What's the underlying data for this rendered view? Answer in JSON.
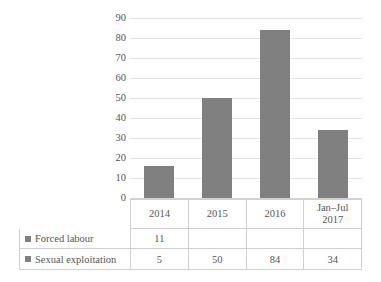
{
  "chart_data": {
    "type": "bar",
    "title": "",
    "xlabel": "",
    "ylabel": "",
    "categories": [
      "2014",
      "2015",
      "2016",
      "Jan–Jul 2017"
    ],
    "values": [
      16,
      50,
      84,
      34
    ],
    "ylim": [
      0,
      90
    ],
    "yticks": [
      0,
      10,
      20,
      30,
      40,
      50,
      60,
      70,
      80,
      90
    ],
    "ytick_labels": [
      "0",
      "10",
      "20",
      "30",
      "40",
      "50",
      "60",
      "70",
      "80",
      "90"
    ],
    "grid": true,
    "legend_position": "data-table",
    "bar_color": "#808080",
    "gridline_color": "#e2e2e2",
    "series": [
      {
        "name": "Forced labour",
        "values": [
          "11",
          "",
          "",
          ""
        ]
      },
      {
        "name": "Sexual exploitation",
        "values": [
          "5",
          "50",
          "84",
          "34"
        ]
      }
    ]
  },
  "categories": {
    "c0": "2014",
    "c1": "2015",
    "c2": "2016",
    "c3": "Jan–Jul 2017"
  },
  "yticks": {
    "t90": "90",
    "t80": "80",
    "t70": "70",
    "t60": "60",
    "t50": "50",
    "t40": "40",
    "t30": "30",
    "t20": "20",
    "t10": "10",
    "t0": "0"
  },
  "table": {
    "row0": {
      "label": "Forced labour",
      "v0": "11",
      "v1": "",
      "v2": "",
      "v3": ""
    },
    "row1": {
      "label": "Sexual exploitation",
      "v0": "5",
      "v1": "50",
      "v2": "84",
      "v3": "34"
    }
  }
}
